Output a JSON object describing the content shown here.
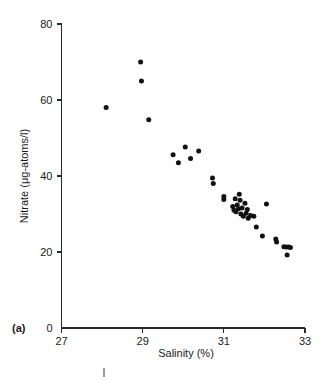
{
  "figure": {
    "panel_label": "(a)",
    "background_color": "#ffffff",
    "point_color": "#111111",
    "axis_color": "#2b2b2b"
  },
  "chart_data": {
    "type": "scatter",
    "title": "",
    "subtitle": "",
    "xlabel": "Salinity (%)",
    "ylabel": "Nitrate (μg-atoms/l)",
    "xlim": [
      27,
      33
    ],
    "ylim": [
      0,
      80
    ],
    "xticks": [
      27,
      29,
      31,
      33
    ],
    "yticks": [
      0,
      20,
      40,
      60,
      80
    ],
    "xtick_labels": [
      "27",
      "29",
      "31",
      "33"
    ],
    "ytick_labels": [
      "0",
      "20",
      "40",
      "60",
      "80"
    ],
    "grid": false,
    "legend": null,
    "annotations": [
      {
        "text": "(a)",
        "position": "bottom-left-outside"
      }
    ],
    "series": [
      {
        "name": "Nitrate vs Salinity",
        "marker": "filled-circle",
        "color": "#111111",
        "points": [
          [
            28.1,
            58.0
          ],
          [
            28.95,
            70.0
          ],
          [
            28.97,
            65.0
          ],
          [
            29.15,
            54.8
          ],
          [
            29.75,
            45.6
          ],
          [
            29.88,
            43.5
          ],
          [
            30.05,
            47.6
          ],
          [
            30.18,
            44.6
          ],
          [
            30.38,
            46.6
          ],
          [
            30.72,
            39.5
          ],
          [
            30.74,
            38.0
          ],
          [
            31.0,
            34.6
          ],
          [
            31.0,
            33.8
          ],
          [
            31.22,
            32.0
          ],
          [
            31.25,
            31.0
          ],
          [
            31.28,
            34.0
          ],
          [
            31.3,
            30.6
          ],
          [
            31.33,
            32.4
          ],
          [
            31.36,
            31.4
          ],
          [
            31.38,
            35.2
          ],
          [
            31.4,
            33.6
          ],
          [
            31.42,
            30.0
          ],
          [
            31.45,
            31.6
          ],
          [
            31.48,
            29.4
          ],
          [
            31.52,
            32.8
          ],
          [
            31.55,
            30.2
          ],
          [
            31.58,
            31.2
          ],
          [
            31.6,
            28.9
          ],
          [
            31.66,
            29.6
          ],
          [
            31.74,
            29.4
          ],
          [
            31.8,
            26.6
          ],
          [
            31.95,
            24.2
          ],
          [
            32.05,
            32.6
          ],
          [
            32.28,
            23.4
          ],
          [
            32.3,
            22.6
          ],
          [
            32.48,
            21.4
          ],
          [
            32.54,
            21.3
          ],
          [
            32.6,
            21.3
          ],
          [
            32.64,
            21.2
          ],
          [
            32.56,
            19.2
          ]
        ]
      }
    ]
  }
}
